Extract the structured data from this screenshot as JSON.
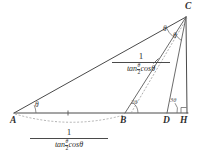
{
  "figure": {
    "type": "geometry-diagram",
    "background_color": "#ffffff",
    "line_color": "#4a4a4a",
    "dash_color": "#9a9a9a"
  },
  "vertices": [
    {
      "name": "A",
      "label": "A",
      "x": 14,
      "y": 118
    },
    {
      "name": "B",
      "label": "B",
      "x": 123,
      "y": 121
    },
    {
      "name": "D",
      "label": "D",
      "x": 165,
      "y": 121
    },
    {
      "name": "H",
      "label": "H",
      "x": 182,
      "y": 121
    },
    {
      "name": "C",
      "label": "C",
      "x": 186,
      "y": 6
    }
  ],
  "angles": [
    {
      "name": "angle-at-A",
      "label": "θ",
      "x": 35,
      "y": 101
    },
    {
      "name": "angle-at-B",
      "label": "2θ",
      "x": 128,
      "y": 100
    },
    {
      "name": "angle-at-D",
      "label": "3θ",
      "x": 168,
      "y": 98
    },
    {
      "name": "angle-at-C-upper",
      "label": "θ",
      "x": 163,
      "y": 26
    },
    {
      "name": "angle-at-C-lower",
      "label": "θ",
      "x": 173,
      "y": 32
    }
  ],
  "measures": {
    "upper_label": {
      "numerator": "1",
      "denominator_prefix": "tan",
      "denominator_inner_num": "θ",
      "denominator_inner_den": "2",
      "denominator_suffix": "cosθ"
    },
    "lower_label": {
      "numerator": "1",
      "denominator_prefix": "tan",
      "denominator_inner_num": "θ",
      "denominator_inner_den": "2",
      "denominator_suffix": "cosθ"
    }
  },
  "marks": {
    "tick_ab": "single-tick",
    "tick_bc": "single-tick",
    "right_angle_h": "right-angle-square",
    "arc_ab": "dashed-arc",
    "dashed_cevian": "dashed-line-parallel-to-BC"
  }
}
